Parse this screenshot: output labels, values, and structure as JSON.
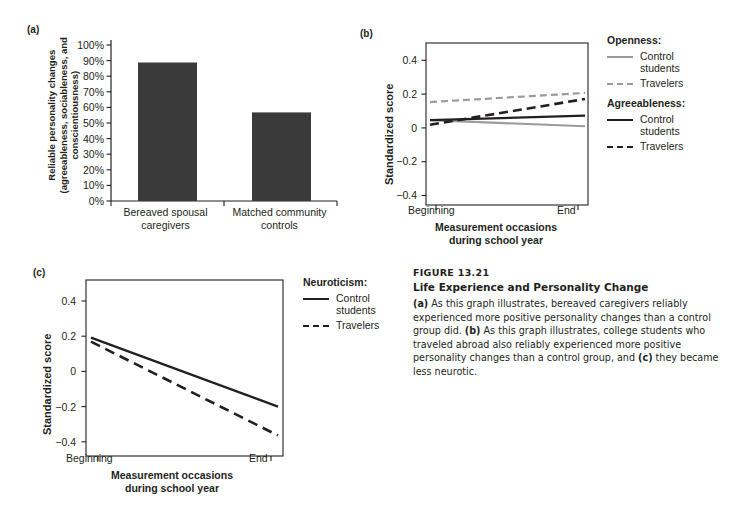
{
  "figure": {
    "number": "FIGURE 13.21",
    "title": "Life Experience and Personality Change",
    "body_a_tag": "(a)",
    "body_part1": " As this graph illustrates, bereaved caregivers reliably experienced more positive personality changes than a control group did. ",
    "body_b_tag": "(b)",
    "body_part2": " As this graph illustrates, college students who traveled abroad also reliably experienced more positive personality changes than a control group, and ",
    "body_c_tag": "(c)",
    "body_part3": " they became less neurotic."
  },
  "colors": {
    "bar_fill": "#3a3a3a",
    "axis": "#231f20",
    "line_dark": "#231f20",
    "line_light": "#9b9b9b",
    "text": "#231f20"
  },
  "panel_a": {
    "letter": "(a)",
    "chart_data": {
      "type": "bar",
      "title": "",
      "xlabel": "",
      "ylabel": "Reliable personality changes (agreeableness, sociableness, and conscientiousness)",
      "ylabel_line1": "Reliable personality changes",
      "ylabel_line2": "(agreeableness, sociableness, and",
      "ylabel_line3": "conscientiousness)",
      "categories": [
        "Bereaved spousal caregivers",
        "Matched community controls"
      ],
      "category_lines": [
        [
          "Bereaved spousal",
          "caregivers"
        ],
        [
          "Matched community",
          "controls"
        ]
      ],
      "values": [
        86,
        55
      ],
      "ylim": [
        0,
        100
      ],
      "yticks": [
        0,
        10,
        20,
        30,
        40,
        50,
        60,
        70,
        80,
        90,
        100
      ],
      "ytick_labels": [
        "0%",
        "10%",
        "20%",
        "30%",
        "40%",
        "50%",
        "60%",
        "70%",
        "80%",
        "90%",
        "100%"
      ],
      "grid": false,
      "legend": "none"
    }
  },
  "panel_b": {
    "letter": "(b)",
    "chart_data": {
      "type": "line",
      "title": "",
      "ylabel": "Standardized score",
      "xlabel_line1": "Measurement occasions",
      "xlabel_line2": "during school year",
      "x": [
        "Beginning",
        "End"
      ],
      "xtick_labels": [
        "Beginning",
        "End"
      ],
      "ylim": [
        -0.55,
        0.52
      ],
      "yticks": [
        -0.4,
        -0.2,
        0,
        0.2,
        0.4
      ],
      "ytick_labels": [
        "−0.4",
        "−0.2",
        "0",
        "0.2",
        "0.4"
      ],
      "grid": false,
      "legend_position": "right",
      "series": [
        {
          "name": "Openness: Control students",
          "group": "Openness",
          "label": "Control students",
          "style": "solid",
          "color": "#9b9b9b",
          "values": [
            0.01,
            -0.03
          ]
        },
        {
          "name": "Openness: Travelers",
          "group": "Openness",
          "label": "Travelers",
          "style": "dashed",
          "color": "#9b9b9b",
          "values": [
            0.13,
            0.19
          ]
        },
        {
          "name": "Agreeableness: Control students",
          "group": "Agreeableness",
          "label": "Control students",
          "style": "solid",
          "color": "#231f20",
          "values": [
            0.01,
            0.04
          ]
        },
        {
          "name": "Agreeableness: Travelers",
          "group": "Agreeableness",
          "label": "Travelers",
          "style": "dashed",
          "color": "#231f20",
          "values": [
            -0.02,
            0.15
          ]
        }
      ]
    },
    "legend": [
      {
        "heading": "Openness:",
        "items": [
          {
            "label": "Control\nstudents",
            "style": "solid",
            "color": "#9b9b9b"
          },
          {
            "label": "Travelers",
            "style": "dashed",
            "color": "#9b9b9b"
          }
        ]
      },
      {
        "heading": "Agreeableness:",
        "items": [
          {
            "label": "Control\nstudents",
            "style": "solid",
            "color": "#231f20"
          },
          {
            "label": "Travelers",
            "style": "dashed",
            "color": "#231f20"
          }
        ]
      }
    ]
  },
  "panel_c": {
    "letter": "(c)",
    "chart_data": {
      "type": "line",
      "title": "",
      "ylabel": "Standardized score",
      "xlabel_line1": "Measurement occasions",
      "xlabel_line2": "during school year",
      "x": [
        "Beginning",
        "End"
      ],
      "xtick_labels": [
        "Beginning",
        "End"
      ],
      "ylim": [
        -0.55,
        0.52
      ],
      "yticks": [
        -0.4,
        -0.2,
        0,
        0.2,
        0.4
      ],
      "ytick_labels": [
        "−0.4",
        "−0.2",
        "0",
        "0.2",
        "0.4"
      ],
      "grid": false,
      "legend_position": "right",
      "series": [
        {
          "name": "Neuroticism: Control students",
          "group": "Neuroticism",
          "label": "Control students",
          "style": "solid",
          "color": "#231f20",
          "values": [
            0.17,
            -0.25
          ]
        },
        {
          "name": "Neuroticism: Travelers",
          "group": "Neuroticism",
          "label": "Travelers",
          "style": "dashed",
          "color": "#231f20",
          "values": [
            0.145,
            -0.425
          ]
        }
      ]
    },
    "legend": [
      {
        "heading": "Neuroticism:",
        "items": [
          {
            "label": "Control\nstudents",
            "style": "solid",
            "color": "#231f20"
          },
          {
            "label": "Travelers",
            "style": "dashed",
            "color": "#231f20"
          }
        ]
      }
    ]
  }
}
